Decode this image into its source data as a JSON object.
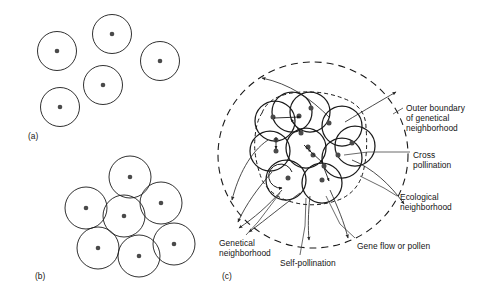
{
  "figure": {
    "background_color": "#ffffff",
    "line_color": "#1a1a1a",
    "dot_color": "#4a4a4a",
    "width": 499,
    "height": 296
  },
  "panels": [
    {
      "tag": "(a)",
      "tag_x": 28,
      "tag_y": 131,
      "description": "Discrete non-overlapping neighborhoods",
      "circle_radius": 19.5,
      "circles": [
        {
          "cx": 57,
          "cy": 51
        },
        {
          "cx": 112,
          "cy": 34
        },
        {
          "cx": 160,
          "cy": 61
        },
        {
          "cx": 103,
          "cy": 85
        },
        {
          "cx": 60,
          "cy": 107
        }
      ]
    },
    {
      "tag": "(b)",
      "tag_x": 35,
      "tag_y": 271,
      "description": "Contiguous tangent neighborhoods",
      "circle_radius": 21,
      "circles": [
        {
          "cx": 130,
          "cy": 177
        },
        {
          "cx": 86,
          "cy": 208
        },
        {
          "cx": 161,
          "cy": 203
        },
        {
          "cx": 124,
          "cy": 216
        },
        {
          "cx": 98,
          "cy": 248
        },
        {
          "cx": 139,
          "cy": 256
        },
        {
          "cx": 174,
          "cy": 244
        }
      ]
    },
    {
      "tag": "(c)",
      "tag_x": 222,
      "tag_y": 271,
      "description": "Overlapping ecological and genetical neighborhoods with gene flow",
      "outer_boundary": {
        "cx": 313,
        "cy": 155,
        "rx": 95,
        "ry": 93
      },
      "ecological_boundary": {
        "cx": 311,
        "cy": 150,
        "rx": 53,
        "ry": 53
      },
      "circle_radius": 20,
      "circles": [
        {
          "cx": 275,
          "cy": 121
        },
        {
          "cx": 310,
          "cy": 112
        },
        {
          "cx": 342,
          "cy": 126
        },
        {
          "cx": 270,
          "cy": 151
        },
        {
          "cx": 306,
          "cy": 148
        },
        {
          "cx": 342,
          "cy": 158
        },
        {
          "cx": 286,
          "cy": 180
        },
        {
          "cx": 322,
          "cy": 183
        },
        {
          "cx": 355,
          "cy": 146
        },
        {
          "cx": 292,
          "cy": 112
        }
      ],
      "dots": [
        {
          "cx": 273,
          "cy": 117
        },
        {
          "cx": 299,
          "cy": 116
        },
        {
          "cx": 311,
          "cy": 108
        },
        {
          "cx": 329,
          "cy": 123
        },
        {
          "cx": 276,
          "cy": 140
        },
        {
          "cx": 276,
          "cy": 151
        },
        {
          "cx": 308,
          "cy": 147
        },
        {
          "cx": 313,
          "cy": 155
        },
        {
          "cx": 338,
          "cy": 155
        },
        {
          "cx": 288,
          "cy": 178
        },
        {
          "cx": 322,
          "cy": 180
        },
        {
          "cx": 324,
          "cy": 166
        },
        {
          "cx": 301,
          "cy": 133
        },
        {
          "cx": 352,
          "cy": 143
        }
      ]
    }
  ],
  "labels": [
    {
      "name": "outer-boundary-label",
      "lines": [
        "Outer boundary",
        "of genetical",
        "neighborhood"
      ],
      "x": 406,
      "y": 103
    },
    {
      "name": "cross-pollination-label",
      "lines": [
        "Cross",
        "pollination"
      ],
      "x": 413,
      "y": 150
    },
    {
      "name": "ecological-neighborhood-label",
      "lines": [
        "Ecological",
        "neighborhood"
      ],
      "x": 400,
      "y": 192
    },
    {
      "name": "genetical-neighborhood-label",
      "lines": [
        "Genetical",
        "neighborhood"
      ],
      "x": 219,
      "y": 238
    },
    {
      "name": "self-pollination-label",
      "lines": [
        "Self-pollination"
      ],
      "x": 280,
      "y": 258
    },
    {
      "name": "gene-flow-label",
      "lines": [
        "Gene flow or pollen"
      ],
      "x": 357,
      "y": 241
    }
  ]
}
